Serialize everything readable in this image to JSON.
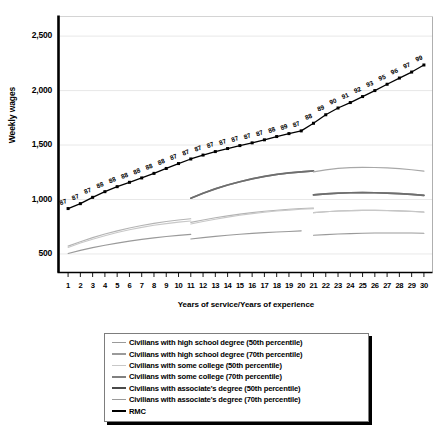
{
  "chart_data": {
    "type": "line",
    "title": "",
    "xlabel": "Years of service/Years of experience",
    "ylabel": "Weekly wages",
    "xlim": [
      0.3,
      30.7
    ],
    "ylim": [
      330,
      2680
    ],
    "yticks": [
      500,
      1000,
      1500,
      2000,
      2500
    ],
    "ytick_labels": [
      "500",
      "1,000",
      "1,500",
      "2,000",
      "2,500"
    ],
    "xticks": [
      1,
      2,
      3,
      4,
      5,
      6,
      7,
      8,
      9,
      10,
      11,
      12,
      13,
      14,
      15,
      16,
      17,
      18,
      19,
      20,
      21,
      22,
      23,
      24,
      25,
      26,
      27,
      28,
      29,
      30
    ],
    "xtick_labels": [
      "1",
      "2",
      "3",
      "4",
      "5",
      "6",
      "7",
      "8",
      "9",
      "10",
      "11",
      "12",
      "13",
      "14",
      "15",
      "16",
      "17",
      "18",
      "19",
      "20",
      "21",
      "22",
      "23",
      "24",
      "25",
      "26",
      "27",
      "28",
      "29",
      "30"
    ],
    "grid": "horizontal",
    "legend_position": "below-axes",
    "x": [
      1,
      2,
      3,
      4,
      5,
      6,
      7,
      8,
      9,
      10,
      11,
      12,
      13,
      14,
      15,
      16,
      17,
      18,
      19,
      20,
      21,
      22,
      23,
      24,
      25,
      26,
      27,
      28,
      29,
      30
    ],
    "series": [
      {
        "name": "RMC",
        "color": "#000000",
        "width": 1.3,
        "markers": true,
        "point_labels": [
          "87",
          "87",
          "87",
          "88",
          "88",
          "88",
          "88",
          "88",
          "88",
          "87",
          "87",
          "87",
          "87",
          "87",
          "87",
          "87",
          "87",
          "88",
          "89",
          "87",
          "88",
          "89",
          "90",
          "91",
          "92",
          "93",
          "95",
          "96",
          "97",
          "99"
        ],
        "values": [
          917,
          962,
          1020,
          1072,
          1118,
          1158,
          1198,
          1240,
          1285,
          1330,
          1372,
          1408,
          1440,
          1468,
          1495,
          1520,
          1548,
          1578,
          1605,
          1630,
          1700,
          1778,
          1840,
          1890,
          1945,
          2000,
          2058,
          2115,
          2170,
          2235
        ]
      },
      {
        "name": "Civilians with high school degree (50th percentile)",
        "color": "#9a9a9a",
        "width": 1.1,
        "markers": false,
        "segments": [
          {
            "x": [
              1,
              2,
              3,
              4,
              5,
              6,
              7,
              8,
              9,
              10,
              11
            ],
            "values": [
              505,
              533,
              558,
              580,
              600,
              618,
              634,
              648,
              660,
              671,
              680
            ]
          },
          {
            "x": [
              11,
              12,
              13,
              14,
              15,
              16,
              17,
              18,
              19,
              20
            ],
            "values": [
              637,
              650,
              662,
              672,
              681,
              689,
              696,
              702,
              707,
              712
            ]
          },
          {
            "x": [
              21,
              22,
              23,
              24,
              25,
              26,
              27,
              28,
              29,
              30
            ],
            "values": [
              672,
              678,
              683,
              687,
              690,
              692,
              693,
              693,
              692,
              690
            ]
          }
        ]
      },
      {
        "name": "Civilians with high school degree (70th percentile)",
        "color": "#b4b4b4",
        "width": 1.1,
        "markers": false,
        "segments": [
          {
            "x": [
              1,
              2,
              3,
              4,
              5,
              6,
              7,
              8,
              9,
              10,
              11
            ],
            "values": [
              572,
              613,
              650,
              683,
              712,
              738,
              761,
              781,
              798,
              812,
              824
            ]
          },
          {
            "x": [
              11,
              12,
              13,
              14,
              15,
              16,
              17,
              18,
              19,
              20,
              21
            ],
            "values": [
              790,
              812,
              832,
              850,
              866,
              880,
              892,
              902,
              910,
              917,
              922
            ]
          },
          {
            "x": [
              21,
              22,
              23,
              24,
              25,
              26,
              27,
              28,
              29,
              30
            ],
            "values": [
              880,
              888,
              894,
              898,
              900,
              900,
              899,
              896,
              892,
              886
            ]
          }
        ]
      },
      {
        "name": "Civilians with some college (50th percentile)",
        "color": "#c8c8c8",
        "width": 1.1,
        "markers": false,
        "segments": [
          {
            "x": [
              1,
              2,
              3,
              4,
              5,
              6,
              7,
              8,
              9,
              10,
              11
            ],
            "values": [
              560,
              600,
              636,
              668,
              697,
              722,
              744,
              763,
              779,
              792,
              803
            ]
          },
          {
            "x": [
              11,
              12,
              13,
              14,
              15,
              16,
              17,
              18,
              19,
              20,
              21
            ],
            "values": [
              775,
              798,
              819,
              838,
              855,
              870,
              883,
              894,
              903,
              910,
              916
            ]
          },
          {
            "x": [
              21,
              22,
              23,
              24,
              25,
              26,
              27,
              28,
              29,
              30
            ],
            "values": [
              880,
              888,
              894,
              898,
              900,
              900,
              898,
              895,
              890,
              884
            ]
          }
        ]
      },
      {
        "name": "Civilians with some college (70th percentile)",
        "color": "#808080",
        "width": 1.6,
        "markers": false,
        "segments": [
          {
            "x": [
              11,
              12,
              13,
              14,
              15,
              16,
              17,
              18,
              19,
              20,
              21
            ],
            "values": [
              1012,
              1058,
              1098,
              1133,
              1163,
              1190,
              1212,
              1230,
              1244,
              1254,
              1262
            ]
          },
          {
            "x": [
              21,
              22,
              23,
              24,
              25,
              26,
              27,
              28,
              29,
              30
            ],
            "values": [
              1043,
              1052,
              1058,
              1062,
              1063,
              1062,
              1059,
              1054,
              1047,
              1038
            ]
          }
        ]
      },
      {
        "name": "Civilians with associate's degree (50th percentile)",
        "color": "#6e6e6e",
        "width": 1.7,
        "markers": false,
        "segments": [
          {
            "x": [
              11,
              12,
              13,
              14,
              15,
              16,
              17,
              18,
              19,
              20,
              21
            ],
            "values": [
              1012,
              1058,
              1098,
              1133,
              1163,
              1190,
              1212,
              1230,
              1244,
              1254,
              1262
            ]
          },
          {
            "x": [
              21,
              22,
              23,
              24,
              25,
              26,
              27,
              28,
              29,
              30
            ],
            "values": [
              1043,
              1052,
              1058,
              1062,
              1063,
              1062,
              1059,
              1054,
              1047,
              1038
            ]
          }
        ]
      },
      {
        "name": "Civilians with associate's degree (70th percentile)",
        "color": "#a8a8a8",
        "width": 1.2,
        "markers": false,
        "segments": [
          {
            "x": [
              21,
              22,
              23,
              24,
              25,
              26,
              27,
              28,
              29,
              30
            ],
            "values": [
              1253,
              1272,
              1285,
              1292,
              1295,
              1294,
              1290,
              1283,
              1273,
              1260
            ]
          }
        ]
      }
    ],
    "legend": [
      {
        "label": "Civilians with high school degree (50th percentile)",
        "color": "#9a9a9a",
        "width": 1.4
      },
      {
        "label": "Civilians with high school degree (70th percentile)",
        "color": "#9a9a9a",
        "width": 1.4
      },
      {
        "label": "Civilians with some college (50th percentile)",
        "color": "#c8c8c8",
        "width": 1.3
      },
      {
        "label": "Civilians with some college (70th percentile)",
        "color": "#808080",
        "width": 1.7
      },
      {
        "label": "Civilians with associate's degree (50th percentile)",
        "color": "#4a4a4a",
        "width": 2.1
      },
      {
        "label": "Civilians with associate's degree (70th percentile)",
        "color": "#9a9a9a",
        "width": 1.4
      },
      {
        "label": "RMC",
        "color": "#000000",
        "width": 2.6
      }
    ]
  }
}
